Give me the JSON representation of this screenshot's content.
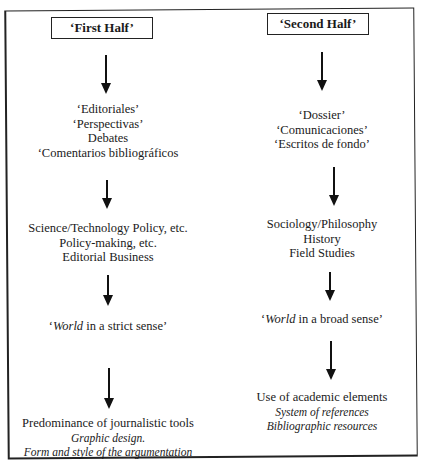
{
  "diagram": {
    "type": "two-column flowchart",
    "columns": [
      {
        "id": "first-half",
        "header": "‘First Half’",
        "stages": [
          {
            "lines": [
              "‘Editoriales’",
              "‘Perspectivas’",
              "Debates",
              "‘Comentarios bibliográficos"
            ]
          },
          {
            "lines": [
              "Science/Technology Policy, etc.",
              "Policy-making, etc.",
              "Editorial Business"
            ]
          },
          {
            "italic_word": "World",
            "rest": " in a strict sense’",
            "prefix": "‘"
          },
          {
            "lines": [
              "Predominance of journalistic tools"
            ],
            "italic_lines": [
              "Graphic design.",
              "Form and style of the argumentation"
            ]
          }
        ]
      },
      {
        "id": "second-half",
        "header": "‘Second Half’",
        "stages": [
          {
            "lines": [
              "‘Dossier’",
              "‘Comunicaciones’",
              "‘Escritos de fondo’"
            ]
          },
          {
            "lines": [
              "Sociology/Philosophy",
              "History",
              "Field Studies"
            ]
          },
          {
            "italic_word": "World",
            "rest": " in a broad sense’",
            "prefix": "‘"
          },
          {
            "lines": [
              "Use of academic elements"
            ],
            "italic_lines": [
              "System of references",
              "Bibliographic resources"
            ]
          }
        ]
      }
    ],
    "arrows_per_column": 4,
    "colors": {
      "line": "#111111",
      "background": "#ffffff",
      "text": "#1a1a1a"
    }
  }
}
